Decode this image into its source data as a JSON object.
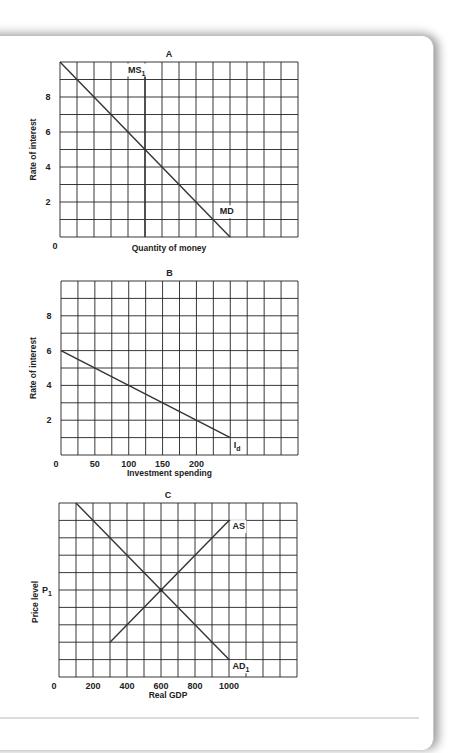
{
  "chart_data": [
    {
      "id": "A",
      "type": "line",
      "title": "A",
      "xlabel": "Quantity of money",
      "ylabel": "Rate of interest",
      "grid": true,
      "cols": 14,
      "rows": 10,
      "xlim": [
        0,
        14
      ],
      "ylim": [
        0,
        10
      ],
      "x_ticks": [
        {
          "value": 0,
          "label": "0"
        }
      ],
      "y_ticks": [
        {
          "value": 2,
          "label": "2"
        },
        {
          "value": 4,
          "label": "4"
        },
        {
          "value": 6,
          "label": "6"
        },
        {
          "value": 8,
          "label": "8"
        }
      ],
      "series": [
        {
          "name": "MD",
          "label": "MD",
          "sub": "",
          "points": [
            [
              0,
              10
            ],
            [
              10,
              0
            ]
          ],
          "label_at": [
            9.4,
            1.3
          ]
        },
        {
          "name": "MS1",
          "label": "MS",
          "sub": "1",
          "points": [
            [
              5,
              0
            ],
            [
              5,
              9.2
            ]
          ],
          "label_at": [
            4.0,
            9.4
          ]
        }
      ]
    },
    {
      "id": "B",
      "type": "line",
      "title": "B",
      "xlabel": "Investment spending",
      "ylabel": "Rate of interest",
      "grid": true,
      "cols": 14,
      "rows": 10,
      "xlim": [
        0,
        350
      ],
      "ylim": [
        0,
        10
      ],
      "x_ticks": [
        {
          "value": 0,
          "label": "0"
        },
        {
          "value": 50,
          "label": "50"
        },
        {
          "value": 100,
          "label": "100"
        },
        {
          "value": 150,
          "label": "150"
        },
        {
          "value": 200,
          "label": "200"
        }
      ],
      "y_ticks": [
        {
          "value": 2,
          "label": "2"
        },
        {
          "value": 4,
          "label": "4"
        },
        {
          "value": 6,
          "label": "6"
        },
        {
          "value": 8,
          "label": "8"
        }
      ],
      "series": [
        {
          "name": "Id",
          "label": "I",
          "sub": "d",
          "points": [
            [
              0,
              6
            ],
            [
              250,
              1
            ]
          ],
          "label_at": [
            255,
            0.4
          ]
        }
      ]
    },
    {
      "id": "C",
      "type": "line",
      "title": "C",
      "xlabel": "Real GDP",
      "ylabel": "Price level",
      "grid": true,
      "cols": 14,
      "rows": 10,
      "xlim": [
        0,
        1400
      ],
      "ylim": [
        0,
        10
      ],
      "x_ticks": [
        {
          "value": 0,
          "label": "0"
        },
        {
          "value": 200,
          "label": "200"
        },
        {
          "value": 400,
          "label": "400"
        },
        {
          "value": 600,
          "label": "600"
        },
        {
          "value": 800,
          "label": "800"
        },
        {
          "value": 1000,
          "label": "1000"
        }
      ],
      "y_ticks": [
        {
          "value": 5,
          "label": "P",
          "sub": "1"
        }
      ],
      "series": [
        {
          "name": "AD1",
          "label": "AD",
          "sub": "1",
          "points": [
            [
              100,
              10
            ],
            [
              1000,
              1
            ]
          ],
          "label_at": [
            1020,
            0.45
          ]
        },
        {
          "name": "AS",
          "label": "AS",
          "sub": "",
          "points": [
            [
              300,
              2
            ],
            [
              1000,
              9
            ]
          ],
          "label_at": [
            1020,
            8.5
          ]
        }
      ],
      "equilibrium": {
        "x": 600,
        "y": 5
      }
    }
  ],
  "layout": {
    "A": {
      "left": 60,
      "top": 62,
      "right": 298,
      "bottom": 237
    },
    "B": {
      "left": 61,
      "top": 281,
      "right": 298,
      "bottom": 455
    },
    "C": {
      "left": 59,
      "top": 503,
      "right": 297,
      "bottom": 677
    }
  }
}
